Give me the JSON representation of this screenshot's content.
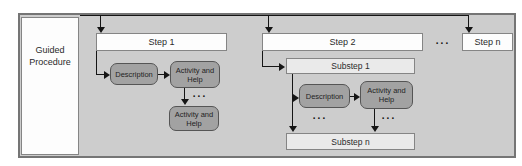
{
  "figure": {
    "sidebar_label": "Guided Procedure",
    "steps": {
      "step1": "Step 1",
      "step2": "Step 2",
      "stepn": "Step n",
      "ellipsis": "..."
    },
    "step1_flow": {
      "description": "Description",
      "activities": [
        "Activity and Help",
        "Activity and Help"
      ],
      "ellipsis": "..."
    },
    "step2_flow": {
      "substep1": "Substep 1",
      "substepn": "Substep n",
      "description": "Description",
      "activity": "Activity and Help",
      "ellipsis_left": "...",
      "ellipsis_right": "..."
    },
    "colors": {
      "panel_background": "#cdcdcd",
      "panel_border": "#757575",
      "step_box_fill": "#fdfdfd",
      "substep_box_fill": "#eaeaea",
      "node_fill": "#a2a2a2",
      "node_border": "#555555",
      "connector": "#151515",
      "text": "#2a2a2a"
    }
  }
}
